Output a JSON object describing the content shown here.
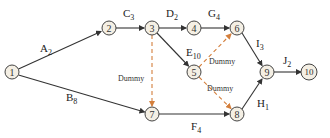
{
  "diagram": {
    "colors": {
      "node_fill": "#f4efe4",
      "node_stroke": "#444444",
      "edge": "#333333",
      "dummy_edge": "#d47f3c"
    },
    "nodes": [
      {
        "id": "1",
        "label": "1",
        "x": 12,
        "y": 72
      },
      {
        "id": "2",
        "label": "2",
        "x": 109,
        "y": 28
      },
      {
        "id": "3",
        "label": "3",
        "x": 152,
        "y": 28
      },
      {
        "id": "4",
        "label": "4",
        "x": 194,
        "y": 28
      },
      {
        "id": "5",
        "label": "5",
        "x": 194,
        "y": 72
      },
      {
        "id": "6",
        "label": "6",
        "x": 237,
        "y": 28
      },
      {
        "id": "7",
        "label": "7",
        "x": 152,
        "y": 114
      },
      {
        "id": "8",
        "label": "8",
        "x": 237,
        "y": 114
      },
      {
        "id": "9",
        "label": "9",
        "x": 267,
        "y": 72
      },
      {
        "id": "10",
        "label": "10",
        "x": 309,
        "y": 72
      }
    ],
    "edges": [
      {
        "from": "1",
        "to": "2",
        "activity": "A",
        "duration": "2",
        "dummy": false
      },
      {
        "from": "1",
        "to": "7",
        "activity": "B",
        "duration": "8",
        "dummy": false
      },
      {
        "from": "2",
        "to": "3",
        "activity": "C",
        "duration": "3",
        "dummy": false
      },
      {
        "from": "3",
        "to": "4",
        "activity": "D",
        "duration": "2",
        "dummy": false
      },
      {
        "from": "3",
        "to": "5",
        "activity": "E",
        "duration": "10",
        "dummy": false
      },
      {
        "from": "4",
        "to": "6",
        "activity": "G",
        "duration": "4",
        "dummy": false
      },
      {
        "from": "3",
        "to": "7",
        "activity": "Dummy",
        "duration": "",
        "dummy": true
      },
      {
        "from": "5",
        "to": "6",
        "activity": "Dummy",
        "duration": "",
        "dummy": true
      },
      {
        "from": "5",
        "to": "8",
        "activity": "Dummy",
        "duration": "",
        "dummy": true
      },
      {
        "from": "6",
        "to": "9",
        "activity": "I",
        "duration": "3",
        "dummy": false
      },
      {
        "from": "7",
        "to": "8",
        "activity": "F",
        "duration": "4",
        "dummy": false
      },
      {
        "from": "8",
        "to": "9",
        "activity": "H",
        "duration": "1",
        "dummy": false
      },
      {
        "from": "9",
        "to": "10",
        "activity": "J",
        "duration": "2",
        "dummy": false
      }
    ],
    "labels": {
      "A": {
        "letter": "A",
        "sub": "2"
      },
      "B": {
        "letter": "B",
        "sub": "8"
      },
      "C": {
        "letter": "C",
        "sub": "3"
      },
      "D": {
        "letter": "D",
        "sub": "2"
      },
      "E": {
        "letter": "E",
        "sub": "10"
      },
      "F": {
        "letter": "F",
        "sub": "4"
      },
      "G": {
        "letter": "G",
        "sub": "4"
      },
      "H": {
        "letter": "H",
        "sub": "1"
      },
      "I": {
        "letter": "I",
        "sub": "3"
      },
      "J": {
        "letter": "J",
        "sub": "2"
      },
      "dummy_text": "Dummy"
    }
  }
}
